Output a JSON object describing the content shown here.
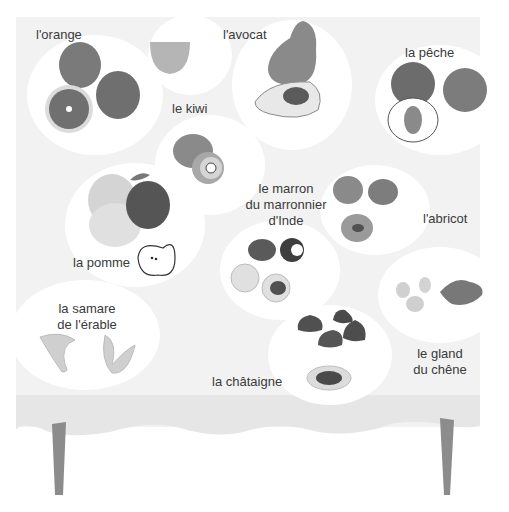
{
  "scene": {
    "title": "fruits on a table",
    "colors": {
      "tablecloth": "#f1f1f1",
      "tablecloth_edge": "#e4e4e4",
      "spot": "#ffffff",
      "table_leg": "#8a8a8a",
      "fruit_dark": "#6e6e6e",
      "fruit_mid": "#9a9a9a",
      "fruit_light": "#c8c8c8"
    }
  },
  "labels": {
    "orange": "l'orange",
    "avocat": "l'avocat",
    "peche": "la pêche",
    "kiwi": "le kiwi",
    "marron_line1": "le marron",
    "marron_line2": "du marronnier",
    "marron_line3": "d'Inde",
    "abricot": "l'abricot",
    "pomme": "la pomme",
    "samare_line1": "la samare",
    "samare_line2": "de l'érable",
    "chataigne": "la châtaigne",
    "gland_line1": "le gland",
    "gland_line2": "du chêne"
  }
}
